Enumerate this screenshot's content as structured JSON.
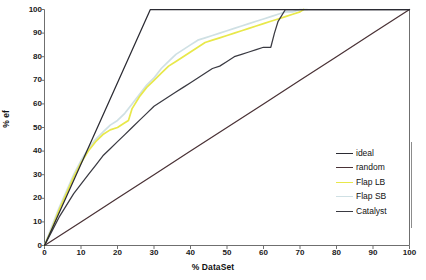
{
  "chart_data": {
    "type": "line",
    "title": "",
    "subtitle": "",
    "xlabel": "% DataSet",
    "ylabel": "% ef",
    "xlim": [
      0,
      100
    ],
    "ylim": [
      0,
      100
    ],
    "xticks": [
      0,
      10,
      20,
      30,
      40,
      50,
      60,
      70,
      80,
      90,
      100
    ],
    "yticks": [
      0,
      10,
      20,
      30,
      40,
      50,
      60,
      70,
      80,
      90,
      100
    ],
    "grid": false,
    "legend_position": "lower-right",
    "series": [
      {
        "name": "ideal",
        "color": "#2b2b33",
        "points": [
          [
            0,
            0
          ],
          [
            29,
            100
          ],
          [
            100,
            100
          ]
        ]
      },
      {
        "name": "random",
        "color": "#4a3236",
        "points": [
          [
            0,
            0
          ],
          [
            10,
            10
          ],
          [
            20,
            20
          ],
          [
            30,
            30
          ],
          [
            40,
            40
          ],
          [
            50,
            50
          ],
          [
            60,
            60
          ],
          [
            70,
            70
          ],
          [
            80,
            80
          ],
          [
            90,
            90
          ],
          [
            100,
            100
          ]
        ]
      },
      {
        "name": "Flap LB",
        "color": "#e8e84a",
        "points": [
          [
            0,
            0
          ],
          [
            2,
            7
          ],
          [
            4,
            15
          ],
          [
            6,
            22
          ],
          [
            8,
            29
          ],
          [
            10,
            35
          ],
          [
            12,
            40
          ],
          [
            14,
            44
          ],
          [
            16,
            47
          ],
          [
            18,
            49
          ],
          [
            20,
            50
          ],
          [
            22,
            52
          ],
          [
            23,
            53
          ],
          [
            24,
            58
          ],
          [
            26,
            63
          ],
          [
            28,
            67
          ],
          [
            30,
            70
          ],
          [
            32,
            73
          ],
          [
            34,
            76
          ],
          [
            36,
            78
          ],
          [
            38,
            80
          ],
          [
            40,
            82
          ],
          [
            42,
            84
          ],
          [
            44,
            86
          ],
          [
            46,
            87
          ],
          [
            48,
            88
          ],
          [
            50,
            89
          ],
          [
            52,
            90
          ],
          [
            54,
            91
          ],
          [
            56,
            92
          ],
          [
            58,
            93
          ],
          [
            60,
            94
          ],
          [
            62,
            95
          ],
          [
            64,
            96
          ],
          [
            66,
            97
          ],
          [
            68,
            98
          ],
          [
            70,
            99
          ],
          [
            71,
            100
          ]
        ]
      },
      {
        "name": "Flap SB",
        "color": "#cfe0e4",
        "points": [
          [
            0,
            0
          ],
          [
            2,
            8
          ],
          [
            4,
            16
          ],
          [
            6,
            23
          ],
          [
            8,
            30
          ],
          [
            10,
            36
          ],
          [
            12,
            41
          ],
          [
            14,
            45
          ],
          [
            16,
            48
          ],
          [
            18,
            51
          ],
          [
            20,
            53
          ],
          [
            22,
            56
          ],
          [
            24,
            60
          ],
          [
            26,
            64
          ],
          [
            28,
            68
          ],
          [
            30,
            71
          ],
          [
            32,
            75
          ],
          [
            34,
            78
          ],
          [
            36,
            81
          ],
          [
            38,
            83
          ],
          [
            40,
            85
          ],
          [
            42,
            87
          ],
          [
            44,
            88
          ],
          [
            46,
            89
          ],
          [
            48,
            90
          ],
          [
            50,
            91
          ],
          [
            52,
            92
          ],
          [
            54,
            93
          ],
          [
            56,
            94
          ],
          [
            58,
            95
          ],
          [
            60,
            96
          ],
          [
            62,
            97
          ],
          [
            64,
            98
          ],
          [
            66,
            99
          ],
          [
            68,
            99
          ],
          [
            70,
            100
          ],
          [
            72,
            100
          ]
        ]
      },
      {
        "name": "Catalyst",
        "color": "#3a3a42",
        "points": [
          [
            0,
            0
          ],
          [
            2,
            6
          ],
          [
            4,
            12
          ],
          [
            6,
            17
          ],
          [
            8,
            22
          ],
          [
            10,
            26
          ],
          [
            12,
            30
          ],
          [
            14,
            34
          ],
          [
            16,
            38
          ],
          [
            18,
            41
          ],
          [
            20,
            44
          ],
          [
            22,
            47
          ],
          [
            24,
            50
          ],
          [
            26,
            53
          ],
          [
            28,
            56
          ],
          [
            30,
            59
          ],
          [
            32,
            61
          ],
          [
            34,
            63
          ],
          [
            36,
            65
          ],
          [
            38,
            67
          ],
          [
            40,
            69
          ],
          [
            42,
            71
          ],
          [
            44,
            73
          ],
          [
            46,
            75
          ],
          [
            48,
            76
          ],
          [
            50,
            78
          ],
          [
            52,
            80
          ],
          [
            54,
            81
          ],
          [
            56,
            82
          ],
          [
            58,
            83
          ],
          [
            60,
            84
          ],
          [
            62,
            84
          ],
          [
            63,
            90
          ],
          [
            64,
            95
          ],
          [
            66,
            100
          ],
          [
            100,
            100
          ]
        ]
      }
    ]
  },
  "axes": {
    "x_title": "% DataSet",
    "y_title": "% ef",
    "x_tick_labels": [
      "0",
      "10",
      "20",
      "30",
      "40",
      "50",
      "60",
      "70",
      "80",
      "90",
      "100"
    ],
    "y_tick_labels": [
      "0",
      "10",
      "20",
      "30",
      "40",
      "50",
      "60",
      "70",
      "80",
      "90",
      "100"
    ]
  },
  "legend": {
    "items": [
      {
        "label": "ideal",
        "color": "#2b2b33"
      },
      {
        "label": "random",
        "color": "#4a3236"
      },
      {
        "label": "Flap LB",
        "color": "#e8e84a"
      },
      {
        "label": "Flap SB",
        "color": "#cfe0e4"
      },
      {
        "label": "Catalyst",
        "color": "#3a3a42"
      }
    ]
  },
  "style": {
    "plot_background": "#ffffff",
    "axis_color": "#6f6f6f",
    "text_color": "#111111"
  }
}
